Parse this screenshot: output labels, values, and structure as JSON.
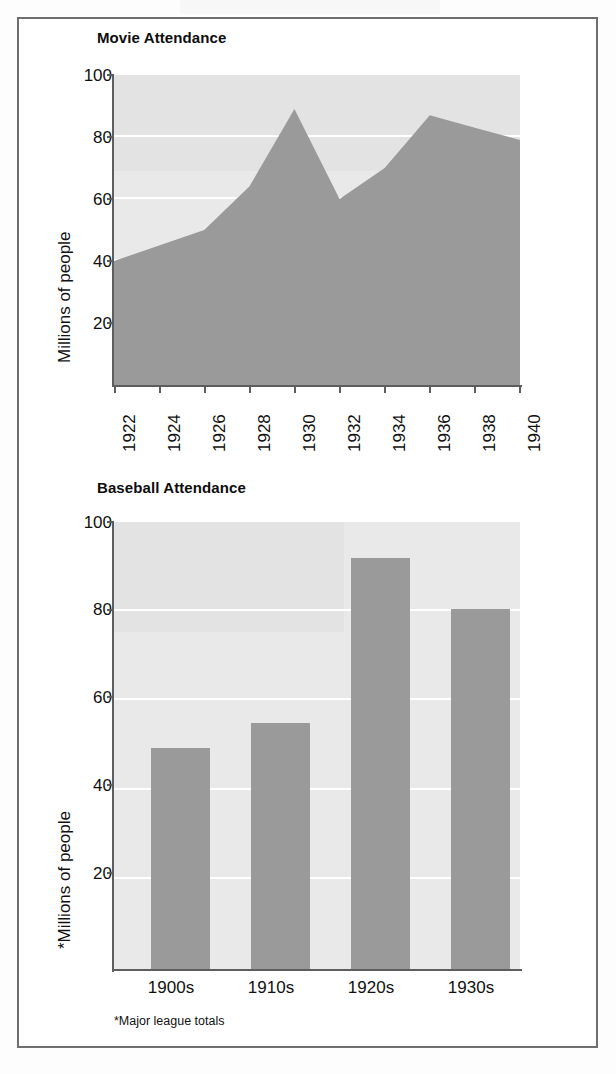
{
  "figure": {
    "border_color": "#6f6f6f",
    "background": "#ffffff",
    "plot_background": "#e9e9e9",
    "series_color": "#9a9a9a",
    "gridline_color": "#ffffff"
  },
  "chart_data": [
    {
      "type": "area",
      "title": "Movie Attendance",
      "xlabel": "",
      "ylabel": "Millions of people",
      "categories": [
        "1922",
        "1924",
        "1926",
        "1928",
        "1930",
        "1932",
        "1934",
        "1936",
        "1938",
        "1940"
      ],
      "x": [
        1922,
        1924,
        1926,
        1928,
        1930,
        1932,
        1934,
        1936,
        1938,
        1940
      ],
      "values": [
        40,
        45,
        50,
        64,
        89,
        60,
        70,
        87,
        83,
        79
      ],
      "ylim": [
        0,
        100
      ],
      "yticks": [
        20,
        40,
        60,
        80,
        100
      ],
      "ytick_labels": [
        "20",
        "40",
        "60",
        "80",
        "100"
      ],
      "xtick_labels": [
        "1922",
        "1924",
        "1926",
        "1928",
        "1930",
        "1932",
        "1934",
        "1936",
        "1938",
        "1940"
      ],
      "grid": true,
      "legend": "none",
      "series_color": "#9a9a9a"
    },
    {
      "type": "bar",
      "title": "Baseball Attendance",
      "xlabel": "",
      "ylabel": "*Millions of people",
      "categories": [
        "1900s",
        "1910s",
        "1920s",
        "1930s"
      ],
      "values": [
        49.5,
        55,
        92,
        80.5
      ],
      "ylim": [
        0,
        100
      ],
      "yticks": [
        20,
        40,
        60,
        80,
        100
      ],
      "ytick_labels": [
        "20",
        "40",
        "60",
        "80",
        "100"
      ],
      "xtick_labels": [
        "1900s",
        "1910s",
        "1920s",
        "1930s"
      ],
      "grid": true,
      "legend": "none",
      "footnote": "*Major league totals",
      "series_color": "#9a9a9a"
    }
  ]
}
